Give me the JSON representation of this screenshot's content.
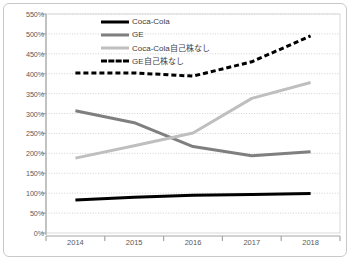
{
  "chart_data": {
    "type": "line",
    "title": "",
    "xlabel": "",
    "ylabel": "",
    "categories": [
      "2014",
      "2015",
      "2016",
      "2017",
      "2018"
    ],
    "x": [
      2014,
      2015,
      2016,
      2017,
      2018
    ],
    "ylim": [
      0,
      550
    ],
    "ytick_step": 50,
    "ytick_labels": [
      "0%",
      "50%",
      "100%",
      "150%",
      "200%",
      "250%",
      "300%",
      "350%",
      "400%",
      "450%",
      "500%",
      "550%"
    ],
    "ytick_values": [
      0,
      50,
      100,
      150,
      200,
      250,
      300,
      350,
      400,
      450,
      500,
      550
    ],
    "grid": "horizontal-dotted",
    "legend_position": "inside-top-center",
    "series": [
      {
        "name": "Coca-Cola",
        "values": [
          83,
          90,
          95,
          97,
          99
        ],
        "color": "#000000",
        "style": "solid",
        "width": 3
      },
      {
        "name": "GE",
        "values": [
          307,
          277,
          217,
          194,
          204
        ],
        "color": "#7f7f7f",
        "style": "solid",
        "width": 3
      },
      {
        "name": "Coca-Cola自己株なし",
        "values": [
          188,
          219,
          251,
          338,
          378
        ],
        "color": "#bfbfbf",
        "style": "solid",
        "width": 3
      },
      {
        "name": "GE自己株なし",
        "values": [
          402,
          402,
          394,
          430,
          495
        ],
        "color": "#000000",
        "style": "dashed",
        "width": 3
      }
    ]
  },
  "colors": {
    "frame_border": "#c9c9c9",
    "plot_border": "#d9d9d9",
    "grid": "#d0d0d0",
    "axis": "#a6a6a6",
    "tick_text": "#595959",
    "legend_text": "#404040",
    "background": "#ffffff"
  }
}
